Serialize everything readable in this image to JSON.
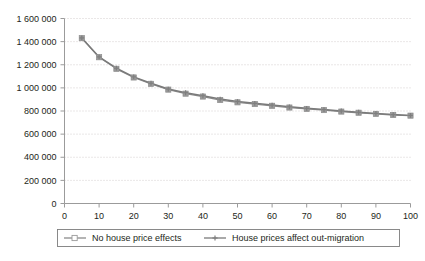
{
  "chart_data": {
    "type": "line",
    "title": "",
    "subtitle": "",
    "xlabel": "",
    "ylabel": "",
    "xlim": [
      0,
      100
    ],
    "ylim": [
      0,
      1600000
    ],
    "grid": "horizontal-dotted",
    "legend_position": "bottom",
    "x": [
      5,
      10,
      15,
      20,
      25,
      30,
      35,
      40,
      45,
      50,
      55,
      60,
      65,
      70,
      75,
      80,
      85,
      90,
      95,
      100
    ],
    "xticks": [
      0,
      10,
      20,
      30,
      40,
      50,
      60,
      70,
      80,
      90,
      100
    ],
    "xtick_labels": [
      "0",
      "10",
      "20",
      "30",
      "40",
      "50",
      "60",
      "70",
      "80",
      "90",
      "100"
    ],
    "yticks": [
      0,
      200000,
      400000,
      600000,
      800000,
      1000000,
      1200000,
      1400000,
      1600000
    ],
    "ytick_labels": [
      "0",
      "200 000",
      "400 000",
      "600 000",
      "800 000",
      "1 000 000",
      "1 200 000",
      "1 400 000",
      "1 600 000"
    ],
    "series": [
      {
        "name": "No house price effects",
        "marker": "square",
        "color": "#9a9a9a",
        "line_color": "#8c8c8c",
        "values": [
          1430000,
          1265000,
          1165000,
          1090000,
          1035000,
          985000,
          950000,
          925000,
          895000,
          875000,
          860000,
          845000,
          830000,
          818000,
          808000,
          795000,
          785000,
          775000,
          765000,
          760000
        ]
      },
      {
        "name": "House prices affect out-migration",
        "marker": "cross",
        "color": "#7f7f7f",
        "line_color": "#7a7a7a",
        "values": [
          1432000,
          1268000,
          1170000,
          1095000,
          1040000,
          990000,
          958000,
          932000,
          903000,
          882000,
          866000,
          851000,
          836000,
          823000,
          812000,
          800000,
          789000,
          779000,
          769000,
          762000
        ]
      }
    ]
  },
  "legend": {
    "items": [
      {
        "label": "No house price effects"
      },
      {
        "label": "House prices affect out-migration"
      }
    ]
  }
}
